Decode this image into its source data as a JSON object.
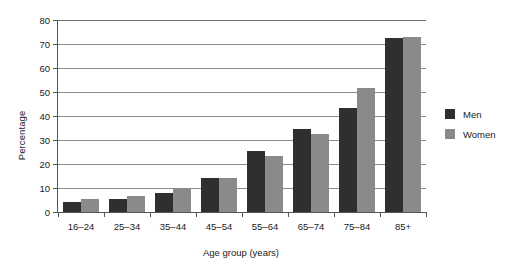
{
  "chart_data": {
    "type": "bar",
    "title": "",
    "xlabel": "Age group (years)",
    "ylabel": "Percentage",
    "categories": [
      "16–24",
      "25–34",
      "35–44",
      "45–54",
      "55–64",
      "65–74",
      "75–84",
      "85+"
    ],
    "series": [
      {
        "name": "Men",
        "color": "#2f2f2f",
        "values": [
          4,
          5.5,
          8,
          14,
          25.5,
          34.5,
          43.5,
          72.5
        ]
      },
      {
        "name": "Women",
        "color": "#8a8a8a",
        "values": [
          5.5,
          6.5,
          9.5,
          14,
          23.5,
          32.5,
          51.5,
          73
        ]
      }
    ],
    "ylim": [
      0,
      80
    ],
    "ytick_labels": [
      "0",
      "10",
      "20",
      "30",
      "40",
      "50",
      "60",
      "70",
      "80"
    ],
    "ytick_values": [
      0,
      10,
      20,
      30,
      40,
      50,
      60,
      70,
      80
    ],
    "grid": true,
    "legend_position": "right",
    "legend_entries": [
      "Men",
      "Women"
    ]
  }
}
